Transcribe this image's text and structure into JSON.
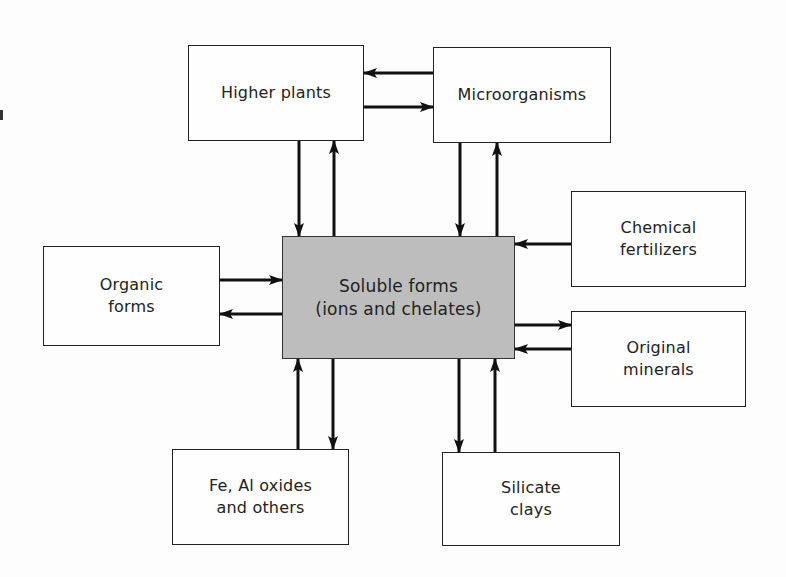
{
  "diagram": {
    "type": "cycle-flow",
    "center": {
      "id": "soluble",
      "label": "Soluble forms\n(ions and chelates)",
      "fill": "#bdbdbd"
    },
    "nodes": [
      {
        "id": "higher_plants",
        "label": "Higher plants"
      },
      {
        "id": "microorganisms",
        "label": "Microorganisms"
      },
      {
        "id": "organic_forms",
        "label": "Organic\nforms"
      },
      {
        "id": "chemical_fertilizers",
        "label": "Chemical\nfertilizers"
      },
      {
        "id": "original_minerals",
        "label": "Original\nminerals"
      },
      {
        "id": "fe_al_oxides",
        "label": "Fe, Al oxides\nand others"
      },
      {
        "id": "silicate_clays",
        "label": "Silicate\nclays"
      }
    ],
    "edges": [
      {
        "from": "microorganisms",
        "to": "higher_plants"
      },
      {
        "from": "higher_plants",
        "to": "microorganisms"
      },
      {
        "from": "higher_plants",
        "to": "soluble"
      },
      {
        "from": "soluble",
        "to": "higher_plants"
      },
      {
        "from": "microorganisms",
        "to": "soluble"
      },
      {
        "from": "soluble",
        "to": "microorganisms"
      },
      {
        "from": "organic_forms",
        "to": "soluble"
      },
      {
        "from": "soluble",
        "to": "organic_forms"
      },
      {
        "from": "chemical_fertilizers",
        "to": "soluble"
      },
      {
        "from": "soluble",
        "to": "original_minerals"
      },
      {
        "from": "original_minerals",
        "to": "soluble"
      },
      {
        "from": "fe_al_oxides",
        "to": "soluble"
      },
      {
        "from": "soluble",
        "to": "fe_al_oxides"
      },
      {
        "from": "soluble",
        "to": "silicate_clays"
      },
      {
        "from": "silicate_clays",
        "to": "soluble"
      }
    ]
  }
}
